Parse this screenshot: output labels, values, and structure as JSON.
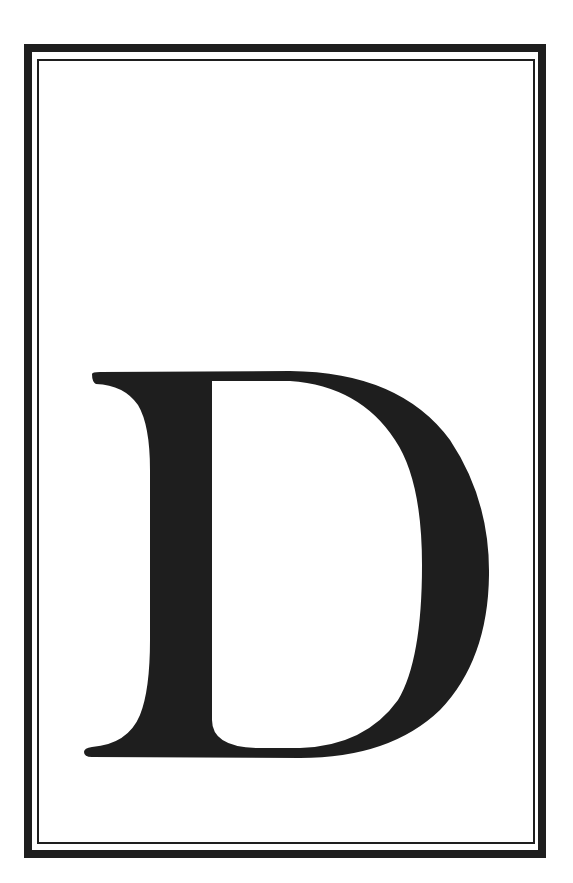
{
  "page": {
    "background_color": "#ffffff"
  },
  "frame": {
    "outer_border_color": "#1e1e1e",
    "inner_border_color": "#1e1e1e"
  },
  "drop_cap": {
    "letter": "D",
    "fill_color": "#1e1e1e"
  }
}
